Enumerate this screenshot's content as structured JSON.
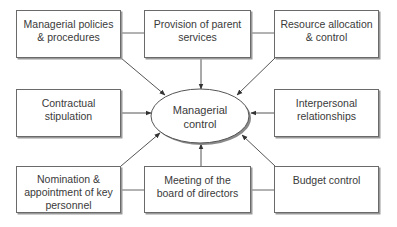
{
  "diagram": {
    "center": {
      "label": "Managerial\ncontrol",
      "shape": "ellipse"
    },
    "nodes": [
      {
        "id": "managerial-policies",
        "label": "Managerial policies\n& procedures",
        "position": "top-left",
        "arrow_to_center": true
      },
      {
        "id": "parent-services",
        "label": "Provision of parent\nservices",
        "position": "top-center",
        "arrow_to_center": true
      },
      {
        "id": "resource-allocation",
        "label": "Resource allocation\n& control",
        "position": "top-right",
        "arrow_to_center": true
      },
      {
        "id": "contractual-stipulation",
        "label": "Contractual\nstipulation",
        "position": "middle-left",
        "arrow_to_center": true
      },
      {
        "id": "interpersonal-relationships",
        "label": "Interpersonal\nrelationships",
        "position": "middle-right",
        "arrow_to_center": true
      },
      {
        "id": "nomination-appointment",
        "label": "Nomination &\nappointment of key\npersonnel",
        "position": "bottom-left",
        "arrow_to_center": true
      },
      {
        "id": "board-meeting",
        "label": "Meeting of the\nboard of directors",
        "position": "bottom-center",
        "arrow_to_center": true
      },
      {
        "id": "budget-control",
        "label": "Budget control",
        "position": "bottom-right",
        "arrow_to_center": true
      }
    ],
    "connectors": [
      {
        "from": "managerial-policies",
        "to": "parent-services",
        "type": "line"
      },
      {
        "from": "parent-services",
        "to": "resource-allocation",
        "type": "line"
      },
      {
        "from": "nomination-appointment",
        "to": "board-meeting",
        "type": "line"
      },
      {
        "from": "board-meeting",
        "to": "budget-control",
        "type": "line"
      }
    ],
    "colors": {
      "stroke": "#555555",
      "text": "#3a3a3a",
      "background": "#ffffff",
      "shadow": "#9a9a9a"
    }
  }
}
